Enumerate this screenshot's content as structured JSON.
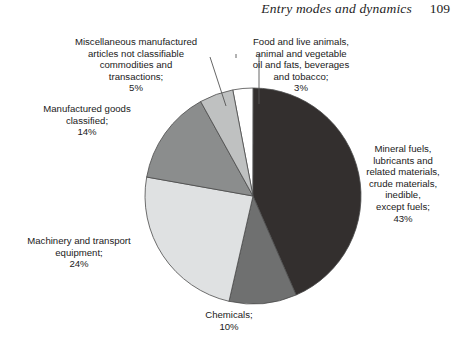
{
  "running_head": {
    "title": "Entry modes and dynamics",
    "page_number": "109"
  },
  "chart_data": {
    "type": "pie",
    "title": "",
    "subtitle": "",
    "xlabel": "",
    "ylabel": "",
    "legend_position": "none",
    "grid": false,
    "units": "percent",
    "start_angle_deg": -10.8,
    "direction": "clockwise",
    "categories": [
      "Food and live animals, animal and vegetable oil and fats, beverages and tobacco",
      "Mineral fuels, lubricants and related materials, crude materials, inedible, except fuels",
      "Chemicals",
      "Machinery and transport equipment",
      "Manufactured goods classified",
      "Miscellaneous manufactured articles not classifiable commodities and transactions"
    ],
    "values": [
      3,
      43,
      10,
      24,
      14,
      5
    ],
    "colors": [
      "#ffffff",
      "#332f2e",
      "#6f7070",
      "#dfe1e2",
      "#8b8d8d",
      "#bfc1c1"
    ],
    "slices": [
      {
        "name": "food",
        "label": "Food and live animals,\nanimal and vegetable\noil and fats, beverages\nand tobacco;",
        "value": 3,
        "value_label": "3%",
        "color": "#ffffff"
      },
      {
        "name": "mineral-fuels",
        "label": "Mineral fuels,\nlubricants and\nrelated materials,\ncrude materials,\ninedible,\nexcept fuels;",
        "value": 43,
        "value_label": "43%",
        "color": "#332f2e"
      },
      {
        "name": "chemicals",
        "label": "Chemicals;",
        "value": 10,
        "value_label": "10%",
        "color": "#6f7070"
      },
      {
        "name": "machinery-transport",
        "label": "Machinery and transport\nequipment;",
        "value": 24,
        "value_label": "24%",
        "color": "#dfe1e2"
      },
      {
        "name": "manufactured-goods",
        "label": "Manufactured goods\nclassified;",
        "value": 14,
        "value_label": "14%",
        "color": "#8b8d8d"
      },
      {
        "name": "miscellaneous",
        "label": "Miscellaneous manufactured\narticles not classifiable\ncommodities and\ntransactions;",
        "value": 5,
        "value_label": "5%",
        "color": "#bfc1c1"
      }
    ]
  },
  "labels": {
    "misc": "Miscellaneous manufactured\narticles not classifiable\ncommodities and\ntransactions;\n5%",
    "food": "Food and live animals,\nanimal and vegetable\noil and fats, beverages\nand tobacco;\n3%",
    "mineral": "Mineral fuels,\nlubricants and\nrelated materials,\ncrude materials,\ninedible,\nexcept fuels;\n43%",
    "manufactured": "Manufactured goods\nclassified;\n14%",
    "machinery": "Machinery and transport\nequipment;\n24%",
    "chemicals": "Chemicals;\n10%"
  }
}
